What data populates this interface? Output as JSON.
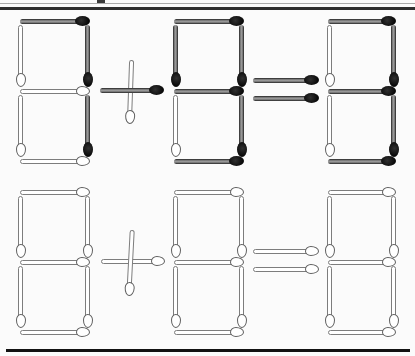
{
  "canvas": {
    "width": 415,
    "height": 356,
    "background": "#fbfbfb"
  },
  "styles": {
    "dark": {
      "body_center": "#9a9a9a",
      "body_edge": "#1d1d1d",
      "head": "#0a0a0a"
    },
    "white": {
      "body": "#ffffff",
      "outline": "#7d7d7d",
      "head_outline": "#5e5e5e"
    }
  },
  "rules": {
    "top_thin": {
      "x": 0,
      "y": 3,
      "w": 415,
      "h": 1,
      "color": "#ababab"
    },
    "top_thick": {
      "x": 0,
      "y": 7,
      "w": 415,
      "h": 2.5,
      "color": "#2e2e2e"
    },
    "corner_tick": {
      "x": 97,
      "y": 0,
      "w": 8,
      "h": 3,
      "color": "#3a3a3a"
    },
    "bottom_bar": {
      "x": 6,
      "y": 349,
      "w": 404,
      "h": 3,
      "color": "#121212"
    }
  },
  "rows": [
    {
      "name": "top-equation",
      "reading": "8 + 8 = 8",
      "match_style": "mixed dark and white-outline matchsticks",
      "elements": [
        {
          "name": "addend-1",
          "type": "digit",
          "matches": [
            {
              "name": "segment-top",
              "cx": 54.5,
              "cy": 21,
              "len": 70,
              "rot": 0,
              "kind": "dark"
            },
            {
              "name": "segment-middle",
              "cx": 54.5,
              "cy": 91,
              "len": 70,
              "rot": 0,
              "kind": "white"
            },
            {
              "name": "segment-bottom",
              "cx": 54.5,
              "cy": 161,
              "len": 70,
              "rot": 0,
              "kind": "white"
            },
            {
              "name": "segment-top-left",
              "cx": 21,
              "cy": 56,
              "len": 62,
              "rot": 90,
              "kind": "white"
            },
            {
              "name": "segment-top-right",
              "cx": 88,
              "cy": 56,
              "len": 62,
              "rot": 90,
              "kind": "dark"
            },
            {
              "name": "segment-bottom-left",
              "cx": 21,
              "cy": 126,
              "len": 62,
              "rot": 90,
              "kind": "white"
            },
            {
              "name": "segment-bottom-right",
              "cx": 88,
              "cy": 126,
              "len": 62,
              "rot": 90,
              "kind": "dark"
            }
          ]
        },
        {
          "name": "plus-sign",
          "type": "operator",
          "matches": [
            {
              "name": "plus-vertical",
              "cx": 131,
              "cy": 92,
              "len": 64,
              "rot": 92,
              "kind": "white"
            },
            {
              "name": "plus-horizontal",
              "cx": 132,
              "cy": 90,
              "len": 64,
              "rot": 0,
              "kind": "dark"
            }
          ]
        },
        {
          "name": "addend-2",
          "type": "digit",
          "matches": [
            {
              "name": "segment-top",
              "cx": 209,
              "cy": 21,
              "len": 70,
              "rot": 0,
              "kind": "dark"
            },
            {
              "name": "segment-middle",
              "cx": 209,
              "cy": 91,
              "len": 70,
              "rot": 0,
              "kind": "dark"
            },
            {
              "name": "segment-bottom",
              "cx": 209,
              "cy": 161,
              "len": 70,
              "rot": 0,
              "kind": "dark"
            },
            {
              "name": "segment-top-left",
              "cx": 176,
              "cy": 56,
              "len": 62,
              "rot": 90,
              "kind": "dark"
            },
            {
              "name": "segment-top-right",
              "cx": 242,
              "cy": 56,
              "len": 62,
              "rot": 90,
              "kind": "dark"
            },
            {
              "name": "segment-bottom-left",
              "cx": 176,
              "cy": 126,
              "len": 62,
              "rot": 90,
              "kind": "white"
            },
            {
              "name": "segment-bottom-right",
              "cx": 242,
              "cy": 126,
              "len": 62,
              "rot": 90,
              "kind": "dark"
            }
          ]
        },
        {
          "name": "equals-sign",
          "type": "operator",
          "matches": [
            {
              "name": "equals-upper-bar",
              "cx": 286,
              "cy": 80,
              "len": 66,
              "rot": 0,
              "kind": "dark"
            },
            {
              "name": "equals-lower-bar",
              "cx": 286,
              "cy": 98,
              "len": 66,
              "rot": 0,
              "kind": "dark"
            }
          ]
        },
        {
          "name": "result",
          "type": "digit",
          "matches": [
            {
              "name": "segment-top",
              "cx": 362,
              "cy": 21,
              "len": 68,
              "rot": 0,
              "kind": "dark"
            },
            {
              "name": "segment-middle",
              "cx": 362,
              "cy": 91,
              "len": 68,
              "rot": 0,
              "kind": "dark"
            },
            {
              "name": "segment-bottom",
              "cx": 362,
              "cy": 161,
              "len": 68,
              "rot": 0,
              "kind": "dark"
            },
            {
              "name": "segment-top-left",
              "cx": 330,
              "cy": 56,
              "len": 62,
              "rot": 90,
              "kind": "white"
            },
            {
              "name": "segment-top-right",
              "cx": 394,
              "cy": 56,
              "len": 62,
              "rot": 90,
              "kind": "dark"
            },
            {
              "name": "segment-bottom-left",
              "cx": 330,
              "cy": 126,
              "len": 62,
              "rot": 90,
              "kind": "white"
            },
            {
              "name": "segment-bottom-right",
              "cx": 394,
              "cy": 126,
              "len": 62,
              "rot": 90,
              "kind": "dark"
            }
          ]
        }
      ]
    },
    {
      "name": "bottom-equation",
      "reading": "8 + 8 = 8",
      "match_style": "all white-outline matchsticks",
      "elements": [
        {
          "name": "addend-1",
          "type": "digit",
          "matches": [
            {
              "name": "segment-top",
              "cx": 54.5,
              "cy": 192,
              "len": 70,
              "rot": 0,
              "kind": "white"
            },
            {
              "name": "segment-middle",
              "cx": 54.5,
              "cy": 262,
              "len": 70,
              "rot": 0,
              "kind": "white"
            },
            {
              "name": "segment-bottom",
              "cx": 54.5,
              "cy": 332,
              "len": 70,
              "rot": 0,
              "kind": "white"
            },
            {
              "name": "segment-top-left",
              "cx": 21,
              "cy": 227,
              "len": 62,
              "rot": 90,
              "kind": "white"
            },
            {
              "name": "segment-top-right",
              "cx": 88,
              "cy": 227,
              "len": 62,
              "rot": 90,
              "kind": "white"
            },
            {
              "name": "segment-bottom-left",
              "cx": 21,
              "cy": 297,
              "len": 62,
              "rot": 90,
              "kind": "white"
            },
            {
              "name": "segment-bottom-right",
              "cx": 88,
              "cy": 297,
              "len": 62,
              "rot": 90,
              "kind": "white"
            }
          ]
        },
        {
          "name": "plus-sign",
          "type": "operator",
          "matches": [
            {
              "name": "plus-horizontal",
              "cx": 133,
              "cy": 261,
              "len": 64,
              "rot": 0,
              "kind": "white"
            },
            {
              "name": "plus-vertical",
              "cx": 131,
              "cy": 263,
              "len": 66,
              "rot": 93,
              "kind": "white"
            }
          ]
        },
        {
          "name": "addend-2",
          "type": "digit",
          "matches": [
            {
              "name": "segment-top",
              "cx": 209,
              "cy": 192,
              "len": 70,
              "rot": 0,
              "kind": "white"
            },
            {
              "name": "segment-middle",
              "cx": 209,
              "cy": 262,
              "len": 70,
              "rot": 0,
              "kind": "white"
            },
            {
              "name": "segment-bottom",
              "cx": 209,
              "cy": 332,
              "len": 70,
              "rot": 0,
              "kind": "white"
            },
            {
              "name": "segment-top-left",
              "cx": 176,
              "cy": 227,
              "len": 62,
              "rot": 90,
              "kind": "white"
            },
            {
              "name": "segment-top-right",
              "cx": 242,
              "cy": 227,
              "len": 62,
              "rot": 90,
              "kind": "white"
            },
            {
              "name": "segment-bottom-left",
              "cx": 176,
              "cy": 297,
              "len": 62,
              "rot": 90,
              "kind": "white"
            },
            {
              "name": "segment-bottom-right",
              "cx": 242,
              "cy": 297,
              "len": 62,
              "rot": 90,
              "kind": "white"
            }
          ]
        },
        {
          "name": "equals-sign",
          "type": "operator",
          "matches": [
            {
              "name": "equals-upper-bar",
              "cx": 286,
              "cy": 251,
              "len": 66,
              "rot": 0,
              "kind": "white"
            },
            {
              "name": "equals-lower-bar",
              "cx": 286,
              "cy": 269,
              "len": 66,
              "rot": 0,
              "kind": "white"
            }
          ]
        },
        {
          "name": "result",
          "type": "digit",
          "matches": [
            {
              "name": "segment-top",
              "cx": 362,
              "cy": 192,
              "len": 68,
              "rot": 0,
              "kind": "white"
            },
            {
              "name": "segment-middle",
              "cx": 362,
              "cy": 262,
              "len": 68,
              "rot": 0,
              "kind": "white"
            },
            {
              "name": "segment-bottom",
              "cx": 362,
              "cy": 332,
              "len": 68,
              "rot": 0,
              "kind": "white"
            },
            {
              "name": "segment-top-left",
              "cx": 330,
              "cy": 227,
              "len": 62,
              "rot": 90,
              "kind": "white"
            },
            {
              "name": "segment-top-right",
              "cx": 394,
              "cy": 227,
              "len": 62,
              "rot": 90,
              "kind": "white"
            },
            {
              "name": "segment-bottom-left",
              "cx": 330,
              "cy": 297,
              "len": 62,
              "rot": 90,
              "kind": "white"
            },
            {
              "name": "segment-bottom-right",
              "cx": 394,
              "cy": 297,
              "len": 62,
              "rot": 90,
              "kind": "white"
            }
          ]
        }
      ]
    }
  ]
}
